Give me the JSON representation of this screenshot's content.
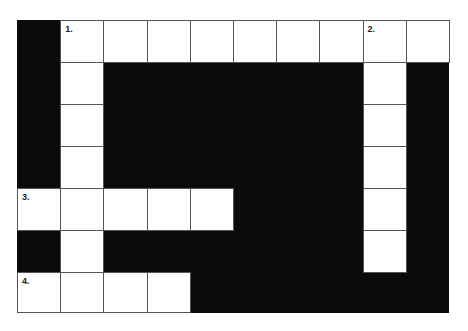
{
  "puzzle": {
    "type": "crossword",
    "cols": 10,
    "rows": 7,
    "cells": [
      {
        "r": 0,
        "c": 1,
        "num": "1."
      },
      {
        "r": 0,
        "c": 2
      },
      {
        "r": 0,
        "c": 3
      },
      {
        "r": 0,
        "c": 4
      },
      {
        "r": 0,
        "c": 5
      },
      {
        "r": 0,
        "c": 6
      },
      {
        "r": 0,
        "c": 7
      },
      {
        "r": 0,
        "c": 8,
        "num": "2."
      },
      {
        "r": 0,
        "c": 9
      },
      {
        "r": 1,
        "c": 1
      },
      {
        "r": 1,
        "c": 8
      },
      {
        "r": 2,
        "c": 1
      },
      {
        "r": 2,
        "c": 8
      },
      {
        "r": 3,
        "c": 1
      },
      {
        "r": 3,
        "c": 8
      },
      {
        "r": 4,
        "c": 0,
        "num": "3."
      },
      {
        "r": 4,
        "c": 1
      },
      {
        "r": 4,
        "c": 2
      },
      {
        "r": 4,
        "c": 3
      },
      {
        "r": 4,
        "c": 4
      },
      {
        "r": 4,
        "c": 8
      },
      {
        "r": 5,
        "c": 1
      },
      {
        "r": 5,
        "c": 8
      },
      {
        "r": 6,
        "c": 0,
        "num": "4."
      },
      {
        "r": 6,
        "c": 1
      },
      {
        "r": 6,
        "c": 2
      },
      {
        "r": 6,
        "c": 3
      }
    ],
    "clue_numbers": [
      "1.",
      "2.",
      "3.",
      "4."
    ]
  }
}
